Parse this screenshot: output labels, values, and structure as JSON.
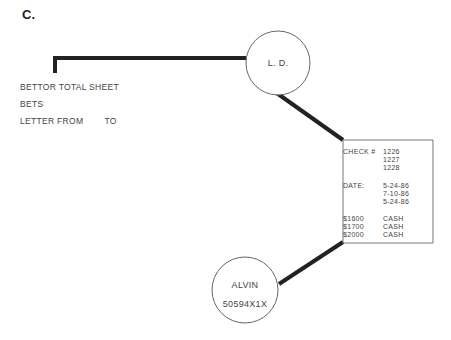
{
  "figure_label": "C.",
  "documents": {
    "items": [
      "BETTOR TOTAL SHEET",
      "BETS",
      "LETTER FROM        TO"
    ]
  },
  "nodes": {
    "ld": {
      "label": "L. D."
    },
    "alvin": {
      "name": "ALVIN",
      "id": "50594X1X"
    }
  },
  "record_box": {
    "check_label": "CHECK #",
    "check_numbers": [
      "1226",
      "1227",
      "1228"
    ],
    "date_label": "DATE:",
    "dates": [
      "5-24-86",
      "7-10-86",
      "5-24-86"
    ],
    "amounts": [
      "$1600",
      "$1700",
      "$2000"
    ],
    "methods": [
      "CASH",
      "CASH",
      "CASH"
    ]
  },
  "colors": {
    "line": "#222222",
    "circle": "#666666",
    "box": "#777777"
  }
}
